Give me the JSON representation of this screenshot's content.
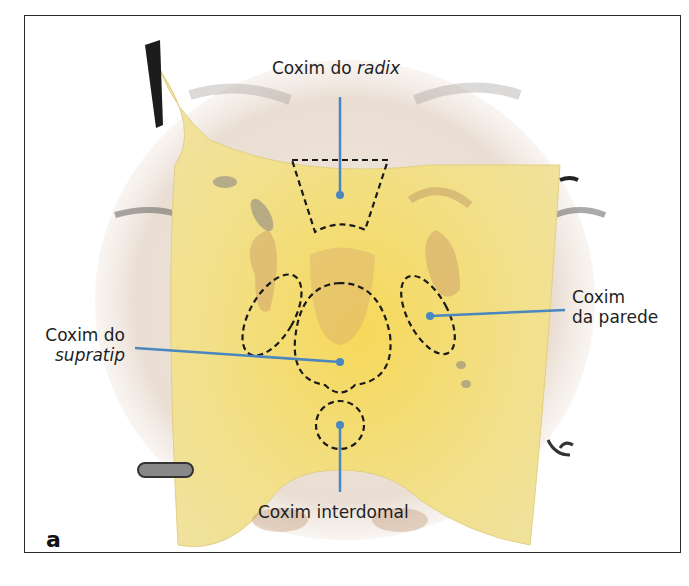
{
  "figure": {
    "panel_letter": "a",
    "labels": {
      "radix": {
        "prefix": "Coxim do ",
        "italic": "radix"
      },
      "supratip": {
        "line1": "Coxim do",
        "italic": "supratip"
      },
      "parede": {
        "line1": "Coxim",
        "line2": "da parede"
      },
      "interdomal": {
        "text": "Coxim interdomal"
      }
    },
    "colors": {
      "leader_line": "#4a86c0",
      "graft_fill": "#f3df7a",
      "dashed_outline": "#1a1a1a",
      "frame": "#2a2a2a"
    }
  }
}
